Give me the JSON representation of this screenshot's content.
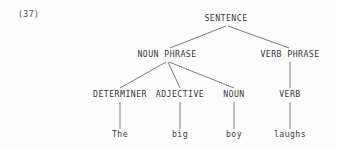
{
  "figure": {
    "example_number": "(37)",
    "background_color": "#fdfdfd",
    "line_color": "#6b6b6d",
    "text_color": "#38383a"
  },
  "tree": {
    "root": {
      "id": "sentence",
      "label": "SENTENCE",
      "x": 226,
      "y": 22
    },
    "level2": [
      {
        "id": "noun-phrase",
        "label": "NOUN PHRASE",
        "x": 167,
        "y": 57
      },
      {
        "id": "verb-phrase",
        "label": "VERB PHRASE",
        "x": 290,
        "y": 57
      }
    ],
    "level3": [
      {
        "id": "determiner",
        "label": "DETERMINER",
        "x": 120,
        "y": 97
      },
      {
        "id": "adjective",
        "label": "ADJECTIVE",
        "x": 180,
        "y": 97
      },
      {
        "id": "noun",
        "label": "NOUN",
        "x": 234,
        "y": 97
      },
      {
        "id": "verb",
        "label": "VERB",
        "x": 290,
        "y": 97
      }
    ],
    "leaves": [
      {
        "id": "leaf-the",
        "label": "The",
        "x": 120,
        "y": 136
      },
      {
        "id": "leaf-big",
        "label": "big",
        "x": 180,
        "y": 136
      },
      {
        "id": "leaf-boy",
        "label": "boy",
        "x": 234,
        "y": 136
      },
      {
        "id": "leaf-laughs",
        "label": "laughs",
        "x": 290,
        "y": 136
      }
    ],
    "edges": [
      {
        "id": "edge-sentence-np",
        "from": "sentence",
        "to": "noun-phrase",
        "x1": 226,
        "y1": 26,
        "x2": 170,
        "y2": 48
      },
      {
        "id": "edge-sentence-vp",
        "from": "sentence",
        "to": "verb-phrase",
        "x1": 228,
        "y1": 26,
        "x2": 289,
        "y2": 48
      },
      {
        "id": "edge-np-det",
        "from": "noun-phrase",
        "to": "determiner",
        "x1": 166,
        "y1": 62,
        "x2": 120,
        "y2": 88
      },
      {
        "id": "edge-np-adj",
        "from": "noun-phrase",
        "to": "adjective",
        "x1": 168,
        "y1": 62,
        "x2": 180,
        "y2": 88
      },
      {
        "id": "edge-np-noun",
        "from": "noun-phrase",
        "to": "noun",
        "x1": 169,
        "y1": 62,
        "x2": 234,
        "y2": 88
      },
      {
        "id": "edge-vp-verb",
        "from": "verb-phrase",
        "to": "verb",
        "x1": 290,
        "y1": 62,
        "x2": 290,
        "y2": 88
      },
      {
        "id": "edge-det-the",
        "from": "determiner",
        "to": "leaf-the",
        "x1": 120,
        "y1": 102,
        "x2": 120,
        "y2": 129
      },
      {
        "id": "edge-adj-big",
        "from": "adjective",
        "to": "leaf-big",
        "x1": 180,
        "y1": 102,
        "x2": 180,
        "y2": 129
      },
      {
        "id": "edge-noun-boy",
        "from": "noun",
        "to": "leaf-boy",
        "x1": 234,
        "y1": 102,
        "x2": 234,
        "y2": 129
      },
      {
        "id": "edge-verb-laughs",
        "from": "verb",
        "to": "leaf-laughs",
        "x1": 290,
        "y1": 102,
        "x2": 290,
        "y2": 129
      }
    ]
  }
}
